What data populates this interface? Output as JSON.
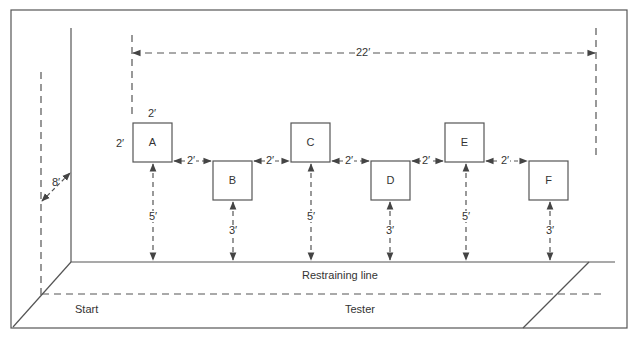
{
  "diagram": {
    "colors": {
      "line": "#555555",
      "text": "#333333",
      "background": "#ffffff"
    },
    "overall_span": {
      "label": "22′"
    },
    "wall_offset": {
      "label": "8′"
    },
    "box_size": {
      "width_label": "2′",
      "height_label": "2′"
    },
    "boxes": [
      {
        "id": "A",
        "label": "A",
        "row": "back",
        "distance_label": "5′"
      },
      {
        "id": "B",
        "label": "B",
        "row": "front",
        "distance_label": "3′"
      },
      {
        "id": "C",
        "label": "C",
        "row": "back",
        "distance_label": "5′"
      },
      {
        "id": "D",
        "label": "D",
        "row": "front",
        "distance_label": "3′"
      },
      {
        "id": "E",
        "label": "E",
        "row": "back",
        "distance_label": "5′"
      },
      {
        "id": "F",
        "label": "F",
        "row": "front",
        "distance_label": "3′"
      }
    ],
    "gaps": [
      {
        "between": "A-B",
        "label": "2′"
      },
      {
        "between": "B-C",
        "label": "2′"
      },
      {
        "between": "C-D",
        "label": "2′"
      },
      {
        "between": "D-E",
        "label": "2′"
      },
      {
        "between": "E-F",
        "label": "2′"
      }
    ],
    "floor_labels": {
      "restraining_line": "Restraining line",
      "start": "Start",
      "tester": "Tester"
    }
  }
}
